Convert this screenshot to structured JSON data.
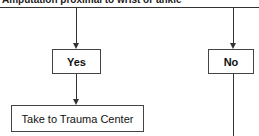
{
  "diagram": {
    "title": "Amputation proximal to wrist or ankle",
    "nodes": {
      "yes": {
        "label": "Yes"
      },
      "no": {
        "label": "No"
      },
      "trauma": {
        "label": "Take to Trauma Center"
      }
    },
    "edges": [
      {
        "from": "title",
        "to": "yes"
      },
      {
        "from": "title",
        "to": "no"
      },
      {
        "from": "yes",
        "to": "trauma"
      },
      {
        "from": "no",
        "to": "below"
      }
    ]
  }
}
